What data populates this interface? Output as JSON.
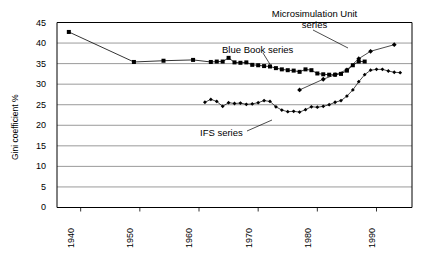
{
  "chart_data": {
    "type": "line",
    "title": "",
    "xlabel": "",
    "ylabel": "Gini coefficient %",
    "xlim": [
      1936,
      1996
    ],
    "ylim": [
      0,
      45
    ],
    "ytick_values": [
      0,
      5,
      10,
      15,
      20,
      25,
      30,
      35,
      40,
      45
    ],
    "xtick_values": [
      1940,
      1950,
      1960,
      1970,
      1980,
      1990
    ],
    "ytick_labels": [
      "0",
      "5",
      "10",
      "15",
      "20",
      "25",
      "30",
      "35",
      "40",
      "45"
    ],
    "xtick_labels": [
      "1940",
      "1950",
      "1960",
      "1970",
      "1980",
      "1990"
    ],
    "grid": "horizontal",
    "legend_position": "inline-annotations",
    "series": [
      {
        "name": "Blue Book series",
        "marker": "square",
        "color": "#000000",
        "points": [
          [
            1938,
            42.7
          ],
          [
            1949,
            35.4
          ],
          [
            1954,
            35.7
          ],
          [
            1959,
            35.9
          ],
          [
            1962,
            35.4
          ],
          [
            1963,
            35.5
          ],
          [
            1964,
            35.5
          ],
          [
            1965,
            36.4
          ],
          [
            1966,
            35.3
          ],
          [
            1967,
            35.2
          ],
          [
            1968,
            35.3
          ],
          [
            1969,
            34.7
          ],
          [
            1970,
            34.6
          ],
          [
            1971,
            34.4
          ],
          [
            1972,
            34.3
          ],
          [
            1973,
            33.9
          ],
          [
            1974,
            33.6
          ],
          [
            1975,
            33.4
          ],
          [
            1976,
            33.3
          ],
          [
            1977,
            33.0
          ],
          [
            1978,
            33.6
          ],
          [
            1979,
            33.4
          ],
          [
            1980,
            32.6
          ],
          [
            1981,
            32.4
          ],
          [
            1982,
            32.3
          ],
          [
            1983,
            32.3
          ],
          [
            1984,
            32.5
          ],
          [
            1985,
            33.3
          ],
          [
            1986,
            34.6
          ],
          [
            1987,
            35.5
          ],
          [
            1988,
            35.5
          ]
        ]
      },
      {
        "name": "Microsimulation Unit series",
        "marker": "diamond",
        "color": "#000000",
        "points": [
          [
            1977,
            28.6
          ],
          [
            1981,
            31.2
          ],
          [
            1983,
            32.3
          ],
          [
            1985,
            33.5
          ],
          [
            1987,
            36.2
          ],
          [
            1989,
            38.0
          ],
          [
            1993,
            39.6
          ]
        ]
      },
      {
        "name": "IFS series",
        "marker": "diamond-small",
        "color": "#000000",
        "points": [
          [
            1961,
            25.6
          ],
          [
            1962,
            26.3
          ],
          [
            1963,
            25.8
          ],
          [
            1964,
            24.6
          ],
          [
            1965,
            25.5
          ],
          [
            1966,
            25.3
          ],
          [
            1967,
            25.4
          ],
          [
            1968,
            25.1
          ],
          [
            1969,
            25.2
          ],
          [
            1970,
            25.5
          ],
          [
            1971,
            26.0
          ],
          [
            1972,
            25.8
          ],
          [
            1973,
            24.5
          ],
          [
            1974,
            23.7
          ],
          [
            1975,
            23.3
          ],
          [
            1976,
            23.4
          ],
          [
            1977,
            23.2
          ],
          [
            1978,
            23.8
          ],
          [
            1979,
            24.5
          ],
          [
            1980,
            24.4
          ],
          [
            1981,
            24.6
          ],
          [
            1982,
            25.0
          ],
          [
            1983,
            25.6
          ],
          [
            1984,
            26.0
          ],
          [
            1985,
            27.1
          ],
          [
            1986,
            28.6
          ],
          [
            1987,
            30.6
          ],
          [
            1988,
            32.3
          ],
          [
            1989,
            33.4
          ],
          [
            1990,
            33.6
          ],
          [
            1991,
            33.6
          ],
          [
            1992,
            33.2
          ],
          [
            1993,
            32.9
          ],
          [
            1994,
            32.8
          ]
        ]
      }
    ],
    "annotations": [
      {
        "text": "Microsimulation Unit",
        "x": 1988,
        "y": 44.2
      },
      {
        "text": "series",
        "x": 1988,
        "y": 42.8
      },
      {
        "text": "Blue Book series",
        "x": 1974,
        "y": 39.0
      },
      {
        "text": "IFS series",
        "x": 1967,
        "y": 21.5
      }
    ]
  },
  "axis": {
    "y_title": "Gini coefficient %",
    "y_ticks": [
      "45",
      "40",
      "35",
      "30",
      "25",
      "20",
      "15",
      "10",
      "5",
      "0"
    ],
    "x_ticks": [
      "1940",
      "1950",
      "1960",
      "1970",
      "1980",
      "1990"
    ]
  },
  "labels": {
    "microsim_line1": "Microsimulation Unit",
    "microsim_line2": "series",
    "bluebook": "Blue Book series",
    "ifs": "IFS series"
  },
  "colors": {
    "grid": "#808080",
    "axis": "#000000",
    "series": "#000000",
    "background": "#ffffff"
  }
}
